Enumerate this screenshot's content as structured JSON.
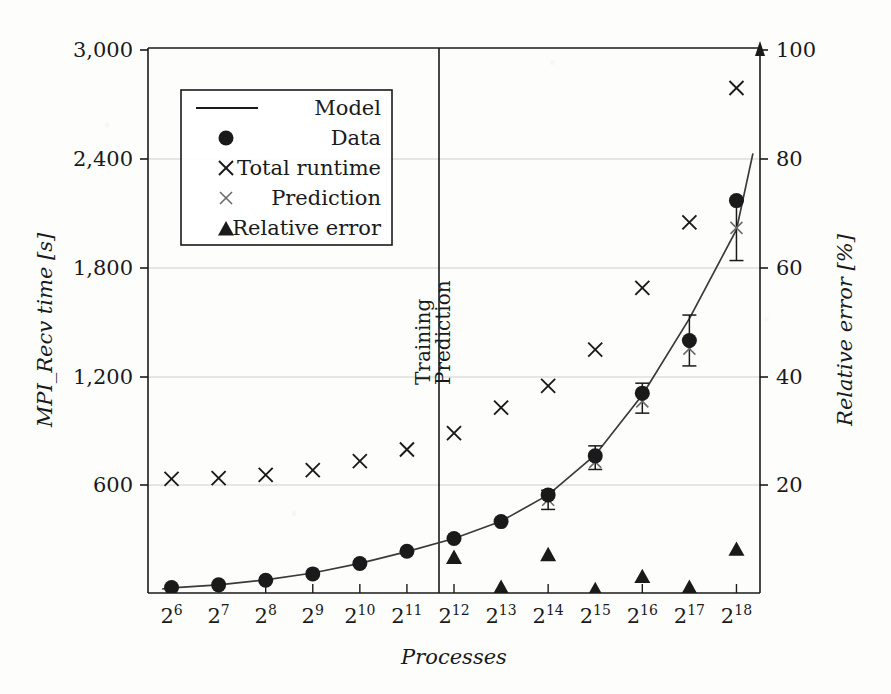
{
  "figure": {
    "kind": "scientific-plot",
    "background_color": "#fdfdfc",
    "ink_color": "#1a1a1a",
    "grid_color": "#cfcfcf",
    "prediction_marker_color": "#6b6b6b"
  },
  "chart_data": {
    "type": "scatter",
    "title": "",
    "xlabel": "Processes",
    "ylabel": "MPI_Recv time [s]",
    "y2label": "Relative error [%]",
    "grid": true,
    "legend_position": "top-left",
    "x_tick_labels": [
      "2^6",
      "2^7",
      "2^8",
      "2^9",
      "2^10",
      "2^11",
      "2^12",
      "2^13",
      "2^14",
      "2^15",
      "2^16",
      "2^17",
      "2^18"
    ],
    "x_tick_bases": [
      "2",
      "2",
      "2",
      "2",
      "2",
      "2",
      "2",
      "2",
      "2",
      "2",
      "2",
      "2",
      "2"
    ],
    "x_tick_exponents": [
      "6",
      "7",
      "8",
      "9",
      "10",
      "11",
      "12",
      "13",
      "14",
      "15",
      "16",
      "17",
      "18"
    ],
    "x": [
      6,
      7,
      8,
      9,
      10,
      11,
      12,
      13,
      14,
      15,
      16,
      17,
      18
    ],
    "xlim": [
      5.5,
      18.5
    ],
    "y_tick_labels": [
      "600",
      "1,200",
      "1,800",
      "2,400",
      "3,000"
    ],
    "y_ticks": [
      600,
      1200,
      1800,
      2400,
      3000
    ],
    "ylim": [
      0,
      3000
    ],
    "y2_tick_labels": [
      "20",
      "40",
      "60",
      "80",
      "100"
    ],
    "y2_ticks": [
      20,
      40,
      60,
      80,
      100
    ],
    "y2lim": [
      0,
      100
    ],
    "regions": [
      {
        "label": "Training",
        "x_from": 6,
        "x_to": 11.5
      },
      {
        "label": "Prediction",
        "x_from": 11.5,
        "x_to": 18.5
      }
    ],
    "divider_x": 11.5,
    "series": [
      {
        "name": "Model",
        "marker": "line",
        "axis": "left",
        "x": [
          5.8,
          6,
          7,
          8,
          9,
          10,
          11,
          12,
          13,
          14,
          15,
          16,
          17,
          18,
          18.35
        ],
        "values": [
          22,
          28,
          45,
          72,
          110,
          163,
          228,
          300,
          395,
          540,
          760,
          1090,
          1510,
          2000,
          2420
        ]
      },
      {
        "name": "Data",
        "marker": "filled-circle",
        "axis": "left",
        "x": [
          6,
          7,
          8,
          9,
          10,
          11,
          12,
          13,
          14,
          15,
          16,
          17,
          18
        ],
        "values": [
          30,
          45,
          70,
          105,
          162,
          230,
          300,
          393,
          540,
          755,
          1100,
          1390,
          2160
        ],
        "error_low": [
          0,
          0,
          0,
          0,
          0,
          0,
          0,
          0,
          460,
          680,
          990,
          1250,
          1830
        ],
        "error_high": [
          0,
          0,
          0,
          0,
          0,
          0,
          0,
          0,
          565,
          810,
          1155,
          1530,
          2160
        ]
      },
      {
        "name": "Total runtime",
        "marker": "cross",
        "axis": "left",
        "x": [
          6,
          7,
          8,
          9,
          10,
          11,
          12,
          13,
          14,
          15,
          16,
          17,
          18
        ],
        "values": [
          628,
          632,
          650,
          676,
          726,
          790,
          880,
          1020,
          1140,
          1340,
          1680,
          2040,
          2780
        ]
      },
      {
        "name": "Prediction",
        "marker": "cross-light",
        "axis": "left",
        "x": [
          14,
          15,
          16,
          17,
          18
        ],
        "values": [
          513,
          722,
          1055,
          1345,
          2010
        ]
      },
      {
        "name": "Relative error",
        "marker": "filled-triangle",
        "axis": "right",
        "x": [
          12,
          13,
          14,
          15,
          16,
          17,
          18
        ],
        "values": [
          6.5,
          1.0,
          7.0,
          0.6,
          3.0,
          1.0,
          8.0
        ]
      }
    ]
  },
  "legend": {
    "entries": [
      {
        "label": "Model",
        "marker": "line"
      },
      {
        "label": "Data",
        "marker": "filled-circle"
      },
      {
        "label": "Total runtime",
        "marker": "cross"
      },
      {
        "label": "Prediction",
        "marker": "cross-light"
      },
      {
        "label": "Relative error",
        "marker": "filled-triangle"
      }
    ]
  },
  "axes": {
    "left_title": "MPI_Recv time [s]",
    "right_title": "Relative error [%]",
    "bottom_title": "Processes"
  }
}
